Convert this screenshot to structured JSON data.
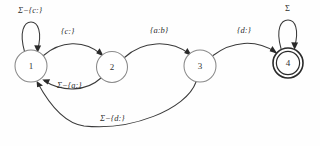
{
  "diagram": {
    "states": [
      {
        "id": "s1",
        "label": "1",
        "accepting": false,
        "cx": 31,
        "cy": 66,
        "r": 16
      },
      {
        "id": "s2",
        "label": "2",
        "accepting": false,
        "cx": 112,
        "cy": 67,
        "r": 15.5
      },
      {
        "id": "s3",
        "label": "3",
        "accepting": false,
        "cx": 200,
        "cy": 66,
        "r": 16
      },
      {
        "id": "s4",
        "label": "4",
        "accepting": true,
        "cx": 288,
        "cy": 63,
        "r": 15
      }
    ],
    "transitions": [
      {
        "id": "t_self1",
        "from": "s1",
        "to": "s1",
        "label": "Σ−{c:}",
        "kind": "self-loop"
      },
      {
        "id": "t_1_2",
        "from": "s1",
        "to": "s2",
        "label": "{c:}",
        "kind": "arc-over"
      },
      {
        "id": "t_2_3",
        "from": "s2",
        "to": "s3",
        "label": "{a:b}",
        "kind": "arc-over"
      },
      {
        "id": "t_3_4",
        "from": "s3",
        "to": "s4",
        "label": "{d:}",
        "kind": "arc-over"
      },
      {
        "id": "t_self4",
        "from": "s4",
        "to": "s4",
        "label": "Σ",
        "kind": "self-loop"
      },
      {
        "id": "t_2_1",
        "from": "s2",
        "to": "s1",
        "label": "Σ−{a:}",
        "kind": "arc-under"
      },
      {
        "id": "t_3_1",
        "from": "s3",
        "to": "s1",
        "label": "Σ−{d:}",
        "kind": "arc-under-long"
      }
    ],
    "labels": {
      "self_loop_1": "Σ−{c:}",
      "edge_1_2": "{c:}",
      "edge_2_3": "{a:b}",
      "edge_3_4": "{d:}",
      "self_loop_4": "Σ",
      "edge_2_1": "Σ−{a:}",
      "edge_3_1": "Σ−{d:}"
    },
    "node_labels": {
      "n1": "1",
      "n2": "2",
      "n3": "3",
      "n4": "4"
    },
    "colors": {
      "edge": "#3a3a3a",
      "node_stroke": "#8a8a8a",
      "accept_stroke": "#2a2a2a",
      "text": "#2e2e2e",
      "background": "#ffffff"
    }
  }
}
